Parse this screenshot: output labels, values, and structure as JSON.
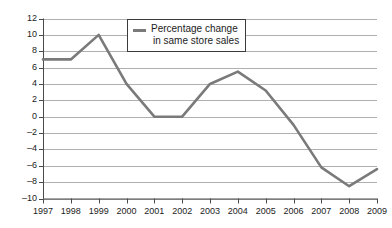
{
  "chart_data": {
    "type": "line",
    "title": "",
    "xlabel": "",
    "ylabel": "",
    "categories": [
      "1997",
      "1998",
      "1999",
      "2000",
      "2001",
      "2002",
      "2003",
      "2004",
      "2005",
      "2006",
      "2007",
      "2008",
      "2009"
    ],
    "values": [
      7,
      7,
      10,
      4,
      0,
      0,
      4,
      5.5,
      3.2,
      -1,
      -6.2,
      -8.5,
      -6.4
    ],
    "series": [
      {
        "name": "Percentage change in same store sales",
        "values": [
          7,
          7,
          10,
          4,
          0,
          0,
          4,
          5.5,
          3.2,
          -1,
          -6.2,
          -8.5,
          -6.4
        ]
      }
    ],
    "ylim": [
      -10,
      12
    ],
    "ytick_labels": [
      "12",
      "10",
      "8",
      "6",
      "4",
      "2",
      "0",
      "–2",
      "–4",
      "–6",
      "–8",
      "–10"
    ],
    "ytick_values": [
      12,
      10,
      8,
      6,
      4,
      2,
      0,
      -2,
      -4,
      -6,
      -8,
      -10
    ],
    "xtick_labels": [
      "1997",
      "1998",
      "1999",
      "2000",
      "2001",
      "2002",
      "2003",
      "2004",
      "2005",
      "2006",
      "2007",
      "2008",
      "2009"
    ],
    "grid": true,
    "legend_position": "top-center",
    "legend": {
      "line1": "Percentage change",
      "line2": "in same store sales",
      "swatch_name": "line-swatch"
    },
    "colors": {
      "series_line": "#7a7a7a",
      "gridline": "#b0b0b0",
      "axis": "#4a4a4a",
      "text": "#1c1c1c",
      "background": "#ffffff"
    }
  }
}
